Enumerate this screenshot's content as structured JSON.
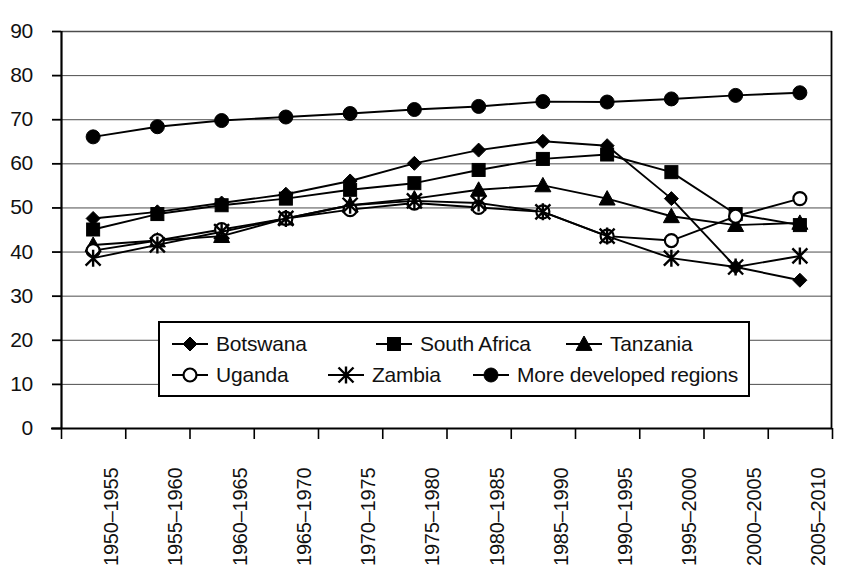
{
  "chart_data": {
    "type": "line",
    "title": "",
    "subtitle": "",
    "xlabel": "",
    "ylabel": "",
    "ylim": [
      0,
      90
    ],
    "ytick_step": 10,
    "yticks": [
      "90",
      "80",
      "70",
      "60",
      "50",
      "40",
      "30",
      "20",
      "10",
      "0"
    ],
    "grid": true,
    "grid_axis": "y",
    "legend_position": "inside-lower-center",
    "categories": [
      "1950–1955",
      "1955–1960",
      "1960–1965",
      "1965–1970",
      "1970–1975",
      "1975–1980",
      "1980–1985",
      "1985–1990",
      "1990–1995",
      "1995–2000",
      "2000–2005",
      "2005–2010"
    ],
    "series": [
      {
        "name": "Botswana",
        "marker": "diamond",
        "filled": true,
        "color": "#000000",
        "values": [
          47.5,
          49.0,
          51.0,
          53.0,
          56.0,
          60.0,
          63.0,
          65.0,
          64.0,
          52.0,
          36.5,
          33.5
        ]
      },
      {
        "name": "South Africa",
        "marker": "square",
        "filled": true,
        "color": "#000000",
        "values": [
          45.0,
          48.5,
          50.5,
          52.0,
          54.0,
          55.5,
          58.5,
          61.0,
          62.0,
          58.0,
          48.5,
          46.0
        ]
      },
      {
        "name": "Tanzania",
        "marker": "triangle",
        "filled": true,
        "color": "#000000",
        "values": [
          41.5,
          42.5,
          43.5,
          47.5,
          50.5,
          52.0,
          54.0,
          55.0,
          52.0,
          48.0,
          46.0,
          46.5
        ]
      },
      {
        "name": "Uganda",
        "marker": "circle-open",
        "filled": false,
        "color": "#000000",
        "values": [
          40.2,
          42.5,
          45.0,
          47.5,
          49.5,
          51.0,
          50.0,
          49.0,
          43.5,
          42.5,
          48.0,
          52.0
        ]
      },
      {
        "name": "Zambia",
        "marker": "asterisk",
        "filled": true,
        "color": "#000000",
        "values": [
          38.5,
          41.5,
          44.5,
          47.5,
          50.5,
          51.5,
          51.0,
          49.0,
          43.5,
          38.5,
          36.5,
          39.0
        ]
      },
      {
        "name": "More developed regions",
        "marker": "circle",
        "filled": true,
        "color": "#000000",
        "values": [
          66.0,
          68.3,
          69.7,
          70.5,
          71.3,
          72.2,
          72.9,
          74.0,
          73.9,
          74.6,
          75.4,
          76.0
        ]
      }
    ]
  },
  "legend": {
    "rows": [
      [
        {
          "label": "Botswana",
          "marker": "diamond"
        },
        {
          "label": "South Africa",
          "marker": "square"
        },
        {
          "label": "Tanzania",
          "marker": "triangle"
        }
      ],
      [
        {
          "label": "Uganda",
          "marker": "circle-open"
        },
        {
          "label": "Zambia",
          "marker": "asterisk"
        },
        {
          "label": "More developed regions",
          "marker": "circle"
        }
      ]
    ]
  }
}
